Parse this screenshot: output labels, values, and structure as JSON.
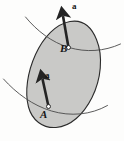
{
  "figure": {
    "type": "mechanics-rigid-body-acceleration-diagram",
    "background_color": "#fdfdfc",
    "body": {
      "name": "rigid-body",
      "fill_color": "#c9c9c7",
      "stroke_color": "#2b2b2b",
      "stroke_width": 1.1,
      "outline_path": "M 96.5 39.5 C 103.5 56.5 101.0 79.5 92.0 97.5 C 83.5 114.5 70.5 126.5 56.0 127.5 C 42.5 128.4 32.0 120.0 28.5 107.0 C 24.5 92.0 27.5 72.0 35.5 54.5 C 43.5 37.0 56.0 24.0 70.0 21.5 C 83.0 19.2 91.5 27.0 96.5 39.5 Z"
    },
    "curves": [
      {
        "name": "upper-path-curve",
        "stroke_color": "#4a4a4a",
        "stroke_width": 0.9,
        "path": "M 25.5 17.0 C 37.0 31.0 52.0 42.5 69.0 47.5 C 86.0 52.5 104.0 51.5 120.5 44.0"
      },
      {
        "name": "lower-path-curve",
        "stroke_color": "#4a4a4a",
        "stroke_width": 0.9,
        "path": "M 3.5 79.0 C 16.5 93.5 33.0 105.5 51.5 111.0 C 70.5 116.6 90.5 115.0 107.5 105.5"
      }
    ],
    "vectors": [
      {
        "name": "acceleration-vector-at-b",
        "label": "a",
        "color": "#242424",
        "shaft_width": 2.6,
        "tail_x": 68.5,
        "tail_y": 47.5,
        "tip_x": 62.0,
        "tip_y": 10.0
      },
      {
        "name": "acceleration-vector-at-a",
        "label": "a",
        "color": "#242424",
        "shaft_width": 2.6,
        "tail_x": 48.5,
        "tail_y": 106.5,
        "tip_x": 41.5,
        "tip_y": 73.0
      }
    ],
    "points": [
      {
        "name": "point-b",
        "label": "B",
        "x": 68.5,
        "y": 47.5,
        "marker": "open-circle",
        "marker_radius": 2.0,
        "marker_fill": "#ffffff",
        "marker_stroke": "#1e1e1e"
      },
      {
        "name": "point-a",
        "label": "A",
        "x": 48.5,
        "y": 106.5,
        "marker": "open-circle",
        "marker_radius": 2.0,
        "marker_fill": "#ffffff",
        "marker_stroke": "#1e1e1e"
      }
    ],
    "labels": {
      "vector_top": "a",
      "point_top": "B",
      "vector_bottom": "a",
      "point_bottom": "A"
    }
  }
}
